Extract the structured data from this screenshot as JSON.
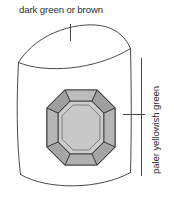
{
  "figure": {
    "background_color": "#ffffff",
    "line_color": "#4a4a4a",
    "labels": {
      "top": {
        "text": "dark green or brown",
        "points_to": "crystal termination / dome top",
        "leader": "vertical-tick"
      },
      "right": {
        "text": "paler yellowish green",
        "points_to": "crystal prism body / side",
        "leader": "horizontal-tick",
        "orientation": "rotated-90-ccw"
      }
    },
    "gem": {
      "cut": "emerald-cut octagon",
      "table_color": "#cdcdcd",
      "facet_color": "#b4b4b4",
      "bevel_color": "#a8a8a8",
      "outline_color": "#3c3c3c"
    },
    "crystal": {
      "shape": "curved prism with domed termination",
      "fill": "#ffffff",
      "outline_color": "#4a4a4a"
    }
  }
}
